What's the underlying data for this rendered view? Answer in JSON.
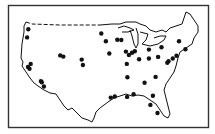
{
  "map": {
    "title": "",
    "region": "Contiguous United States",
    "marker_color": "#111111",
    "outline_color": "#111111",
    "frame_color": "#333333",
    "background": "#ffffff",
    "markers": [
      {
        "id": "m1",
        "lon": -122.3,
        "lat": 47.6
      },
      {
        "id": "m2",
        "lon": -122.7,
        "lat": 45.5
      },
      {
        "id": "m3",
        "lon": -122.4,
        "lat": 37.8
      },
      {
        "id": "m4",
        "lon": -121.9,
        "lat": 37.3
      },
      {
        "id": "m5",
        "lon": -121.5,
        "lat": 38.6
      },
      {
        "id": "m6",
        "lon": -118.2,
        "lat": 34.1
      },
      {
        "id": "m7",
        "lon": -117.9,
        "lat": 33.8
      },
      {
        "id": "m8",
        "lon": -117.2,
        "lat": 32.7
      },
      {
        "id": "m9",
        "lon": -111.9,
        "lat": 40.8
      },
      {
        "id": "m10",
        "lon": -110.9,
        "lat": 40.5
      },
      {
        "id": "m11",
        "lon": -104.9,
        "lat": 39.7
      },
      {
        "id": "m12",
        "lon": -104.5,
        "lat": 38.3
      },
      {
        "id": "m13",
        "lon": -98.5,
        "lat": 46.5
      },
      {
        "id": "m14",
        "lon": -97.0,
        "lat": 44.5
      },
      {
        "id": "m15",
        "lon": -95.9,
        "lat": 41.3
      },
      {
        "id": "m16",
        "lon": -93.3,
        "lat": 44.9
      },
      {
        "id": "m17",
        "lon": -92.0,
        "lat": 44.8
      },
      {
        "id": "m18",
        "lon": -90.2,
        "lat": 38.6
      },
      {
        "id": "m19",
        "lon": -90.5,
        "lat": 41.8
      },
      {
        "id": "m20",
        "lon": -89.5,
        "lat": 40.9
      },
      {
        "id": "m21",
        "lon": -88.5,
        "lat": 41.5
      },
      {
        "id": "m22",
        "lon": -87.6,
        "lat": 41.9
      },
      {
        "id": "m23",
        "lon": -86.2,
        "lat": 39.8
      },
      {
        "id": "m24",
        "lon": -95.4,
        "lat": 29.8
      },
      {
        "id": "m25",
        "lon": -94.1,
        "lat": 30.1
      },
      {
        "id": "m26",
        "lon": -90.1,
        "lat": 30.0
      },
      {
        "id": "m27",
        "lon": -88.0,
        "lat": 30.7
      },
      {
        "id": "m28",
        "lon": -83.0,
        "lat": 40.0
      },
      {
        "id": "m29",
        "lon": -83.0,
        "lat": 42.3
      },
      {
        "id": "m30",
        "lon": -80.0,
        "lat": 40.4
      },
      {
        "id": "m31",
        "lon": -78.9,
        "lat": 42.9
      },
      {
        "id": "m32",
        "lon": -77.0,
        "lat": 38.9
      },
      {
        "id": "m33",
        "lon": -76.6,
        "lat": 39.3
      },
      {
        "id": "m34",
        "lon": -75.2,
        "lat": 40.0
      },
      {
        "id": "m35",
        "lon": -74.0,
        "lat": 40.7
      },
      {
        "id": "m36",
        "lon": -73.2,
        "lat": 44.5
      },
      {
        "id": "m37",
        "lon": -71.1,
        "lat": 42.4
      },
      {
        "id": "m38",
        "lon": -80.8,
        "lat": 35.2
      },
      {
        "id": "m39",
        "lon": -81.7,
        "lat": 30.3
      },
      {
        "id": "m40",
        "lon": -82.5,
        "lat": 27.9
      },
      {
        "id": "m41",
        "lon": -80.2,
        "lat": 25.8
      },
      {
        "id": "m42",
        "lon": -84.4,
        "lat": 33.7
      },
      {
        "id": "m43",
        "lon": -90.0,
        "lat": 35.1
      }
    ]
  }
}
